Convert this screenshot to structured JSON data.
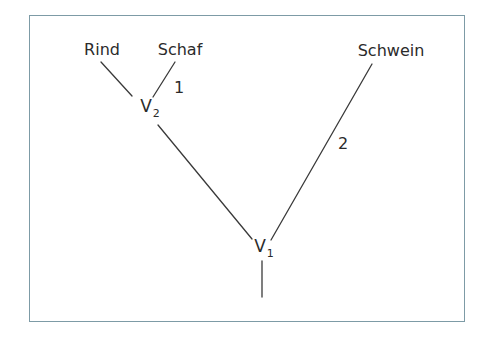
{
  "diagram": {
    "type": "phylogenetic-tree",
    "frame_color": "#7d9ba6",
    "line_color": "#3a3a3a",
    "leaves": [
      {
        "id": "rind",
        "label": "Rind"
      },
      {
        "id": "schaf",
        "label": "Schaf"
      },
      {
        "id": "schwein",
        "label": "Schwein"
      }
    ],
    "nodes": [
      {
        "id": "v2",
        "letter": "V",
        "subscript": "2"
      },
      {
        "id": "v1",
        "letter": "V",
        "subscript": "1"
      }
    ],
    "branch_labels": [
      {
        "id": "branch-schaf",
        "label": "1"
      },
      {
        "id": "branch-schwein",
        "label": "2"
      }
    ],
    "edges": [
      {
        "from": "v2",
        "to": "rind"
      },
      {
        "from": "v2",
        "to": "schaf",
        "label": "1"
      },
      {
        "from": "v1",
        "to": "v2"
      },
      {
        "from": "v1",
        "to": "schwein",
        "label": "2"
      },
      {
        "from": "root",
        "to": "v1"
      }
    ]
  }
}
